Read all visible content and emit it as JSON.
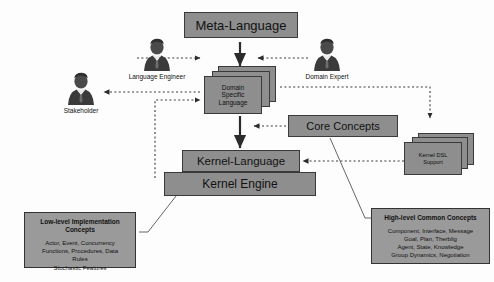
{
  "diagram": {
    "title_box": {
      "label": "Meta-Language"
    },
    "dsl_stack": {
      "line1": "Domain",
      "line2": "Specific",
      "line3": "Language"
    },
    "core_concepts": {
      "label": "Core Concepts"
    },
    "kernel_dsl_stack": {
      "line1": "Kernel DSL",
      "line2": "Support"
    },
    "kernel_language": {
      "label": "Kernel-Language"
    },
    "kernel_engine": {
      "label": "Kernel Engine"
    },
    "actors": [
      {
        "name": "language-engineer",
        "label": "Language Engineer"
      },
      {
        "name": "domain-expert",
        "label": "Domain Expert"
      },
      {
        "name": "stakeholder",
        "label": "Stakeholder"
      }
    ],
    "low_level_box": {
      "title_line1": "Low-level Implementation",
      "title_line2": "Concepts",
      "body_line1": "Actor, Event, Concurrency",
      "body_line2": "Functions, Procedures, Data",
      "body_line3": "Rules",
      "body_line4": "Stochastic Features"
    },
    "high_level_box": {
      "title_line1": "High-level Common Concepts",
      "body_line1": "Component, Interface, Message",
      "body_line2": "Goal, Plan, Therblig",
      "body_line3": "Agent, State, Knowledge",
      "body_line4": "Group Dynamics, Negotiation"
    },
    "colors": {
      "box_fill": "#8e8e8e",
      "concept_fill": "#9a9a9a",
      "stroke": "#333333",
      "background": "#fdfdfd"
    }
  }
}
